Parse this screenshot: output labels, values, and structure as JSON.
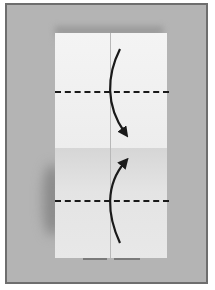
{
  "image": {
    "subject": "origami folding step photo",
    "fold_lines": [
      "upper dashed fold line",
      "lower dashed fold line"
    ],
    "arrows": [
      "curved arrow pointing down",
      "curved arrow pointing up"
    ],
    "colors": {
      "frame": "#6e6e6e",
      "background": "#b4b4b4",
      "paper": "#f0f0f0",
      "ink": "#1a1a1a"
    }
  }
}
